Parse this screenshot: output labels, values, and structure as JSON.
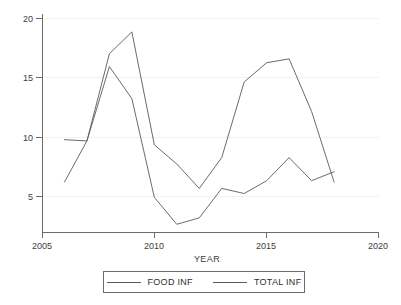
{
  "chart_data": {
    "type": "line",
    "title": "",
    "xlabel": "YEAR",
    "ylabel": "",
    "x": [
      2006,
      2007,
      2008,
      2009,
      2010,
      2011,
      2012,
      2013,
      2014,
      2015,
      2016,
      2017,
      2018
    ],
    "xlim": [
      2005,
      2020
    ],
    "ylim": [
      3.6,
      20.6
    ],
    "xticks": [
      2005,
      2010,
      2015,
      2020
    ],
    "xtick_labels": [
      "2005",
      "2010",
      "2015",
      "2020"
    ],
    "yticks": [
      5,
      10,
      15,
      20
    ],
    "ytick_labels": [
      "5",
      "10",
      "15",
      "20"
    ],
    "grid": false,
    "legend_position": "bottom",
    "series": [
      {
        "name": "FOOD INF",
        "color": "#5a5a5a",
        "values": [
          10.8,
          10.7,
          16.5,
          14.0,
          6.3,
          4.2,
          4.7,
          7.0,
          6.6,
          7.6,
          9.4,
          7.6,
          8.3
        ]
      },
      {
        "name": "TOTAL INF",
        "color": "#5a5a5a",
        "values": [
          7.5,
          10.7,
          17.5,
          19.2,
          10.4,
          8.9,
          7.0,
          9.4,
          15.3,
          16.8,
          17.1,
          13.0,
          7.5
        ]
      }
    ]
  },
  "legend": {
    "entries": [
      {
        "label": "FOOD INF"
      },
      {
        "label": "TOTAL INF"
      }
    ]
  },
  "axes": {
    "x_title": "YEAR"
  }
}
